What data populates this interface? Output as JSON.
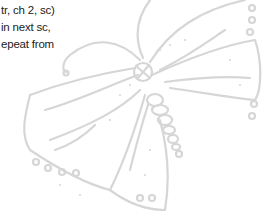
{
  "pattern_text": {
    "lines": [
      "tr, ch 2, sc)",
      "in next sc,",
      "epeat from"
    ]
  },
  "illustration": {
    "subject": "butterfly line drawing",
    "stroke_color": "#d6d6d6"
  }
}
